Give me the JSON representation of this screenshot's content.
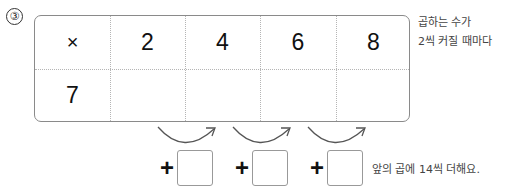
{
  "problem_number": "③",
  "table": {
    "header_row": [
      "×",
      "2",
      "4",
      "6",
      "8"
    ],
    "second_row": [
      "7",
      "",
      "",
      "",
      ""
    ]
  },
  "side_note": {
    "line1": "곱하는 수가",
    "line2": "2씩 커질 때마다"
  },
  "increments": [
    {
      "sign": "+",
      "value": ""
    },
    {
      "sign": "+",
      "value": ""
    },
    {
      "sign": "+",
      "value": ""
    }
  ],
  "bottom_note": "앞의 곱에 14씩 더해요.",
  "colors": {
    "border": "#8a8a8a",
    "grid": "#b5b5b5",
    "text": "#111111",
    "note_text": "#444444"
  }
}
